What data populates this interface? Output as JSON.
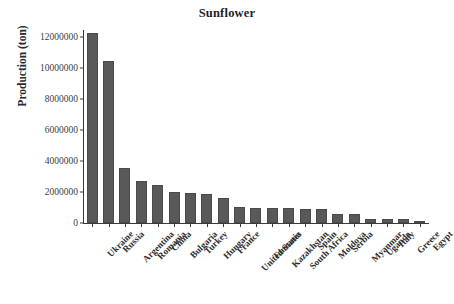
{
  "chart_data": {
    "type": "bar",
    "title": "Sunflower",
    "xlabel": "",
    "ylabel": "Production (ton)",
    "ylim": [
      0,
      13000000
    ],
    "grid": false,
    "legend": null,
    "bar_color": "#595959",
    "axis_color": "#3a3a3a",
    "y_ticks": [
      0,
      2000000,
      4000000,
      6000000,
      8000000,
      10000000,
      12000000
    ],
    "y_tick_labels": [
      "0",
      "2000000",
      "4000000",
      "6000000",
      "8000000",
      "10000000",
      "12000000"
    ],
    "categories": [
      "Ukraine",
      "Russia",
      "Argentina",
      "Romania",
      "China",
      "Bulgaria",
      "Turkey",
      "Hungary",
      "France",
      "United States",
      "Tanzania",
      "Kazakhstan",
      "South Africa",
      "Spain",
      "Moldova",
      "Serbia",
      "Myanmar",
      "Uganda",
      "Italy",
      "Greece",
      "Egypt"
    ],
    "values": [
      12260000,
      10440000,
      3550000,
      2700000,
      2450000,
      2000000,
      1950000,
      1870000,
      1600000,
      1030000,
      980000,
      950000,
      940000,
      920000,
      880000,
      600000,
      550000,
      260000,
      250000,
      250000,
      30000
    ]
  }
}
